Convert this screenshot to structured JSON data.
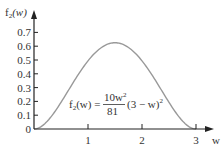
{
  "chart_data": {
    "type": "line",
    "title": "",
    "xlabel": "w",
    "ylabel": "f2(w)",
    "ylabel_main": "f",
    "ylabel_sub": "2",
    "ylabel_arg": "(w)",
    "xlim": [
      0,
      3.3
    ],
    "ylim": [
      0,
      0.75
    ],
    "x_ticks": [
      1,
      2,
      3
    ],
    "x_tick_labels": [
      "1",
      "2",
      "3"
    ],
    "y_ticks": [
      0,
      0.1,
      0.2,
      0.3,
      0.4,
      0.5,
      0.6,
      0.7
    ],
    "y_tick_labels": [
      "0",
      "0.1",
      "0.2",
      "0.3",
      "0.4",
      "0.5",
      "0.6",
      "0.7"
    ],
    "grid": false,
    "legend": null,
    "annotation": {
      "lhs": "f2(w) =",
      "numerator": "10w²",
      "denominator": "81",
      "rhs": "(3 − w)²"
    },
    "series": [
      {
        "name": "f2(w) = (10w^2/81)(3 - w)^2",
        "x": [
          0,
          0.25,
          0.5,
          0.75,
          1.0,
          1.25,
          1.5,
          1.75,
          2.0,
          2.25,
          2.5,
          2.75,
          3.0
        ],
        "values": [
          0,
          0.0059,
          0.0193,
          0.0312,
          0.0494,
          0.0587,
          0.0625,
          0.0587,
          0.0494,
          0.0352,
          0.0193,
          0.0059,
          0
        ],
        "values_scaled": [
          0,
          0.059,
          0.193,
          0.352,
          0.494,
          0.591,
          0.625,
          0.591,
          0.494,
          0.352,
          0.193,
          0.059,
          0
        ]
      }
    ],
    "colors": {
      "curve": "#999999",
      "axis": "#222222"
    }
  },
  "labels": {
    "y_axis_f": "f",
    "y_axis_sub": "2",
    "y_axis_arg": "(w)",
    "x_axis": "w",
    "eq_lhs_f": "f",
    "eq_lhs_sub": "2",
    "eq_lhs_rest": "(w) =",
    "eq_num": "10w",
    "eq_num_exp": "2",
    "eq_den": "81",
    "eq_rhs": "(3 − w)",
    "eq_rhs_exp": "2",
    "xt1": "1",
    "xt2": "2",
    "xt3": "3",
    "yt0": "0",
    "yt1": "0.1",
    "yt2": "0.2",
    "yt3": "0.3",
    "yt4": "0.4",
    "yt5": "0.5",
    "yt6": "0.6",
    "yt7": "0.7"
  }
}
